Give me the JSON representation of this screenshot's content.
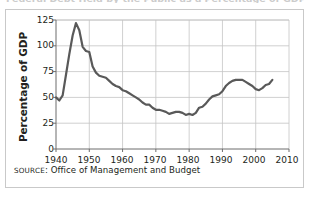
{
  "figure": {
    "title_cut_off": "Federal Debt Held by the Public as a Percentage of GDP",
    "source_prefix": "SOURCE",
    "source_separator": ": ",
    "source_text": "Office of Management and Budget",
    "border_color": "#c9c9c9",
    "background_color": "#ffffff"
  },
  "chart_data": {
    "type": "line",
    "title": "",
    "xlabel": "",
    "ylabel": "Percentage of GDP",
    "xlim": [
      1940,
      2010
    ],
    "ylim": [
      0,
      125
    ],
    "grid": true,
    "legend": null,
    "line_color": "#595959",
    "line_width": 2.2,
    "x_ticks": [
      1940,
      1950,
      1960,
      1970,
      1980,
      1990,
      2000,
      2010
    ],
    "x_tick_labels": [
      "1940",
      "1950",
      "1960",
      "1970",
      "1980",
      "1990",
      "2000",
      "2010"
    ],
    "y_ticks": [
      0,
      25,
      50,
      75,
      100,
      125
    ],
    "y_tick_labels": [
      "0",
      "25",
      "50",
      "75",
      "100",
      "125"
    ],
    "series": [
      {
        "name": "Federal debt held by the public",
        "x": [
          1940,
          1941,
          1942,
          1943,
          1944,
          1945,
          1946,
          1947,
          1948,
          1949,
          1950,
          1951,
          1952,
          1953,
          1954,
          1955,
          1956,
          1957,
          1958,
          1959,
          1960,
          1961,
          1962,
          1963,
          1964,
          1965,
          1966,
          1967,
          1968,
          1969,
          1970,
          1971,
          1972,
          1973,
          1974,
          1975,
          1976,
          1977,
          1978,
          1979,
          1980,
          1981,
          1982,
          1983,
          1984,
          1985,
          1986,
          1987,
          1988,
          1989,
          1990,
          1991,
          1992,
          1993,
          1994,
          1995,
          1996,
          1997,
          1998,
          1999,
          2000,
          2001,
          2002,
          2003,
          2004,
          2005
        ],
        "values": [
          50,
          47,
          52,
          72,
          92,
          110,
          122,
          115,
          99,
          95,
          94,
          80,
          74,
          71,
          70,
          69,
          66,
          63,
          61,
          60,
          57,
          56,
          54,
          52,
          50,
          48,
          45,
          43,
          43,
          40,
          38,
          38,
          37,
          36,
          34,
          35,
          36,
          36,
          35,
          33,
          34,
          33,
          35,
          40,
          41,
          44,
          48,
          51,
          52,
          53,
          56,
          61,
          64,
          66,
          67,
          67,
          67,
          65,
          63,
          61,
          58,
          57,
          59,
          62,
          63,
          67
        ]
      }
    ]
  },
  "axes": {
    "y_axis_label": "Percentage of GDP"
  }
}
